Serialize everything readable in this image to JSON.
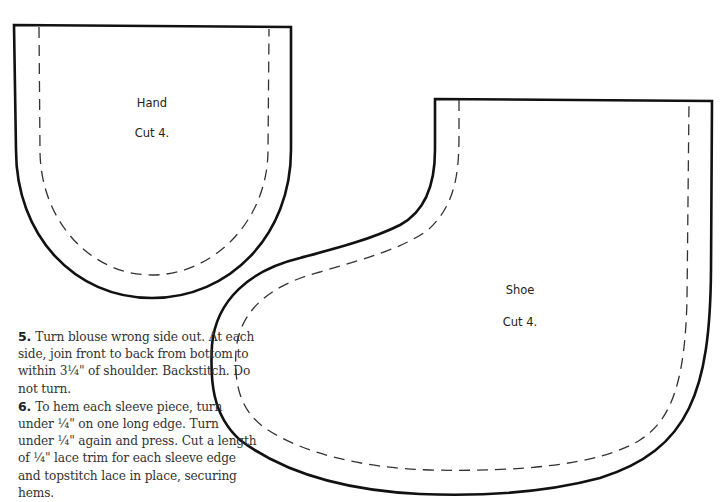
{
  "pieces": [
    {
      "id": "hand",
      "name": "Hand",
      "cut": "Cut 4."
    },
    {
      "id": "shoe",
      "name": "Shoe",
      "cut": "Cut 4."
    }
  ],
  "instructions": [
    {
      "number": "5.",
      "text": "Turn blouse wrong side out. At each side, join front to back from bottom to within 3¼\" of shoulder. Backstitch. Do not turn."
    },
    {
      "number": "6.",
      "text": "To hem each sleeve piece, turn under ¼\" on one long edge. Turn under ¼\" again and press. Cut a length of ¼\" lace trim for each sleeve edge and topstitch lace in place, securing hems."
    }
  ],
  "colors": {
    "line": "#111111",
    "background": "#ffffff",
    "text": "#333333"
  }
}
